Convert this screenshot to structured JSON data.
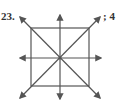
{
  "question_number": "23.",
  "answer": "; 4",
  "figure": {
    "stroke_color": "#555555",
    "square": {
      "x": 31,
      "y": 28,
      "size": 58
    },
    "center": {
      "x": 60,
      "y": 58
    },
    "arrow_count": 8
  }
}
